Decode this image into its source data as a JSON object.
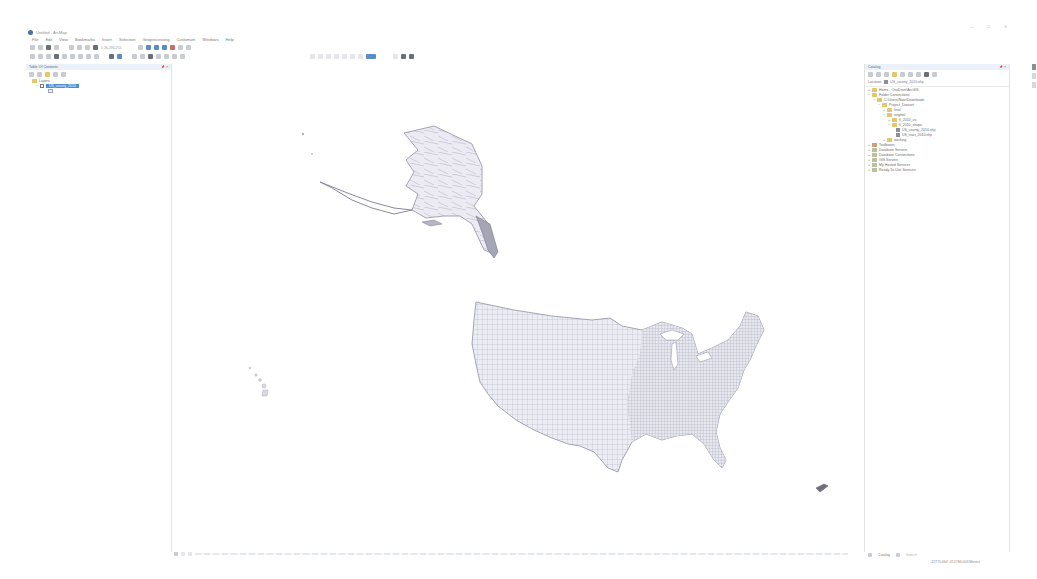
{
  "window": {
    "title": "Untitled - ArcMap",
    "controls": [
      "minimize",
      "maximize",
      "close"
    ]
  },
  "menubar": {
    "items": [
      "File",
      "Edit",
      "View",
      "Bookmarks",
      "Insert",
      "Selection",
      "Geoprocessing",
      "Customize",
      "Windows",
      "Help"
    ]
  },
  "toolbar": {
    "scale": "1:26,294,255"
  },
  "toc": {
    "title": "Table Of Contents",
    "pin": "📌",
    "close": "×",
    "root": "Layers",
    "layer": "US_county_2010"
  },
  "catalog": {
    "title": "Catalog",
    "location_label": "Location:",
    "location_value": "US_county_2010.shp",
    "tree": [
      {
        "label": "Home - OneDrive\\ArcGIS",
        "indent": 0,
        "icon": "folder"
      },
      {
        "label": "Folder Connections",
        "indent": 0,
        "icon": "folder"
      },
      {
        "label": "C:\\Users\\Nate\\Downloads",
        "indent": 1,
        "icon": "folder"
      },
      {
        "label": "Project_Dataset",
        "indent": 2,
        "icon": "folder"
      },
      {
        "label": "final",
        "indent": 3,
        "icon": "folder"
      },
      {
        "label": "original",
        "indent": 3,
        "icon": "folder"
      },
      {
        "label": "tl_2010_us",
        "indent": 4,
        "icon": "folder"
      },
      {
        "label": "tl_2010_shape",
        "indent": 4,
        "icon": "folder"
      },
      {
        "label": "US_county_2010.shp",
        "indent": 5,
        "icon": "shapefile"
      },
      {
        "label": "US_tract_2010.shp",
        "indent": 5,
        "icon": "shapefile"
      },
      {
        "label": "working",
        "indent": 3,
        "icon": "folder"
      },
      {
        "label": "Toolboxes",
        "indent": 0,
        "icon": "toolbox"
      },
      {
        "label": "Database Servers",
        "indent": 0,
        "icon": "server"
      },
      {
        "label": "Database Connections",
        "indent": 0,
        "icon": "server"
      },
      {
        "label": "GIS Servers",
        "indent": 0,
        "icon": "server"
      },
      {
        "label": "My Hosted Services",
        "indent": 0,
        "icon": "server"
      },
      {
        "label": "Ready-To-Use Services",
        "indent": 0,
        "icon": "server"
      }
    ]
  },
  "bottom_tabs": {
    "catalog": "Catalog",
    "search": "Search"
  },
  "status": {
    "coordinates": "-12775.064  -412784.003 Meters"
  },
  "map": {
    "layer_fill": "#ececf4",
    "layer_outline": "#8f8fa3"
  }
}
